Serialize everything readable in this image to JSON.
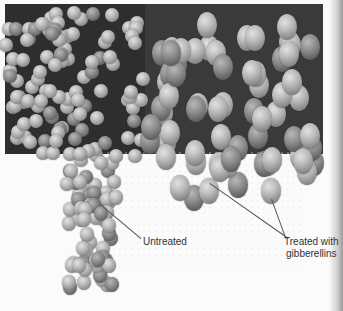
{
  "figure": {
    "labels": {
      "untreated": "Untreated",
      "treated_line1": "Treated with",
      "treated_line2": "gibberellins"
    }
  }
}
